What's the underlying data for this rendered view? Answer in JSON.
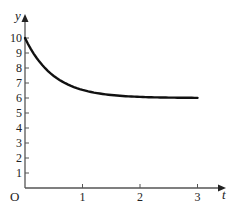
{
  "chart_data": {
    "type": "line",
    "title": "",
    "xlabel": "t",
    "ylabel": "y",
    "origin_label": "O",
    "xlim": [
      0,
      3.4
    ],
    "ylim": [
      0,
      11
    ],
    "x_ticks": [
      1,
      2,
      3
    ],
    "x_tick_labels": [
      "1",
      "2",
      "3"
    ],
    "y_ticks": [
      1,
      2,
      3,
      4,
      5,
      6,
      7,
      8,
      9,
      10
    ],
    "y_tick_labels": [
      "1",
      "2",
      "3",
      "4",
      "5",
      "6",
      "7",
      "8",
      "9",
      "10"
    ],
    "grid": false,
    "legend": null,
    "series": [
      {
        "name": "y(t)",
        "color": "#111111",
        "x": [
          0,
          0.25,
          0.5,
          0.75,
          1.0,
          1.25,
          1.5,
          1.75,
          2.0,
          2.25,
          2.5,
          2.75,
          3.0
        ],
        "values": [
          10.0,
          8.43,
          7.47,
          6.89,
          6.54,
          6.33,
          6.2,
          6.12,
          6.07,
          6.04,
          6.03,
          6.02,
          6.01
        ]
      }
    ],
    "asymptote": 6
  }
}
